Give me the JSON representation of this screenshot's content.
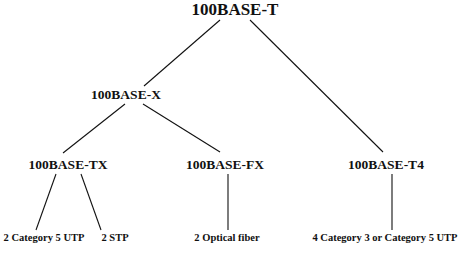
{
  "diagram": {
    "type": "tree",
    "root": {
      "label": "100BASE-T",
      "children": [
        {
          "label": "100BASE-X",
          "children": [
            {
              "label": "100BASE-TX",
              "children": [
                {
                  "label": "2 Category 5 UTP"
                },
                {
                  "label": "2 STP"
                }
              ]
            },
            {
              "label": "100BASE-FX",
              "children": [
                {
                  "label": "2 Optical fiber"
                }
              ]
            }
          ]
        },
        {
          "label": "100BASE-T4",
          "children": [
            {
              "label": "4 Category 3 or Category 5 UTP"
            }
          ]
        }
      ]
    }
  },
  "nodes": {
    "root": "100BASE-T",
    "x": "100BASE-X",
    "tx": "100BASE-TX",
    "fx": "100BASE-FX",
    "t4": "100BASE-T4",
    "leaf_tx_utp": "2 Category 5 UTP",
    "leaf_tx_stp": "2 STP",
    "leaf_fx_fiber": "2 Optical fiber",
    "leaf_t4_utp": "4 Category 3 or Category 5 UTP"
  },
  "colors": {
    "line": "#111111",
    "text": "#111111",
    "background": "#ffffff"
  }
}
